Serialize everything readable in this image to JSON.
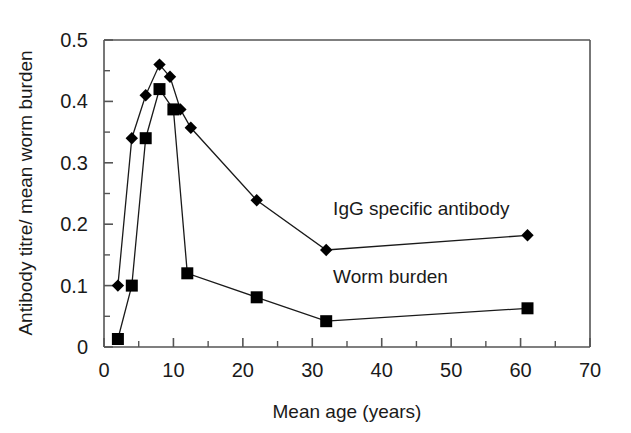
{
  "chart_data": {
    "type": "line",
    "title": "",
    "xlabel": "Mean age (years)",
    "ylabel": "Antibody titre/ mean worm burden",
    "xlim": [
      0,
      70
    ],
    "ylim": [
      0,
      0.5
    ],
    "xticks": [
      0,
      10,
      20,
      30,
      40,
      50,
      60,
      70
    ],
    "xtick_labels": [
      "0",
      "10",
      "20",
      "30",
      "40",
      "50",
      "60",
      "70"
    ],
    "yticks": [
      0,
      0.1,
      0.2,
      0.3,
      0.4,
      0.5
    ],
    "ytick_labels": [
      "0",
      "0.1",
      "0.2",
      "0.3",
      "0.4",
      "0.5"
    ],
    "y_minor_ticks": [
      0.05,
      0.15,
      0.25,
      0.35,
      0.45
    ],
    "grid": false,
    "legend": "inline-annotations",
    "line_color": "#1a1a1a",
    "marker_color": "#000000",
    "frame_color": "#555555",
    "series": [
      {
        "name": "IgG specific antibody",
        "marker": "diamond",
        "annotation_x": 33,
        "annotation_y": 0.215,
        "points": [
          {
            "x": 2.0,
            "y": 0.1
          },
          {
            "x": 4.0,
            "y": 0.34
          },
          {
            "x": 6.0,
            "y": 0.41
          },
          {
            "x": 8.0,
            "y": 0.46
          },
          {
            "x": 9.5,
            "y": 0.44
          },
          {
            "x": 11.0,
            "y": 0.387
          },
          {
            "x": 12.5,
            "y": 0.357
          },
          {
            "x": 22.0,
            "y": 0.239
          },
          {
            "x": 32.0,
            "y": 0.158
          },
          {
            "x": 61.0,
            "y": 0.182
          }
        ]
      },
      {
        "name": "Worm burden",
        "marker": "square",
        "annotation_x": 33,
        "annotation_y": 0.105,
        "points": [
          {
            "x": 2.0,
            "y": 0.013
          },
          {
            "x": 4.0,
            "y": 0.1
          },
          {
            "x": 6.0,
            "y": 0.34
          },
          {
            "x": 8.0,
            "y": 0.42
          },
          {
            "x": 10.0,
            "y": 0.387
          },
          {
            "x": 12.0,
            "y": 0.12
          },
          {
            "x": 22.0,
            "y": 0.081
          },
          {
            "x": 32.0,
            "y": 0.042
          },
          {
            "x": 61.0,
            "y": 0.063
          }
        ]
      }
    ]
  }
}
